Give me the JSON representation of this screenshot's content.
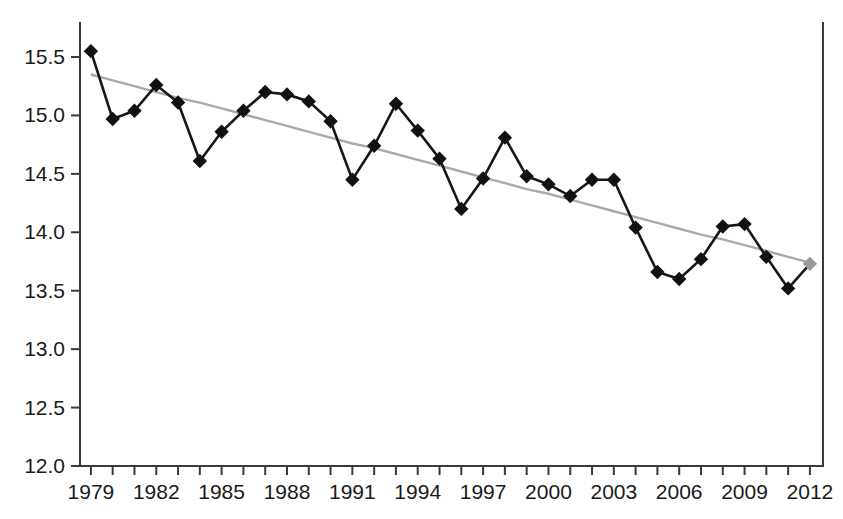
{
  "chart_data": {
    "type": "line",
    "title": "",
    "subtitle": "",
    "xlabel": "",
    "ylabel": "",
    "xlim": [
      1978.5,
      2012.6
    ],
    "ylim": [
      12.0,
      15.7
    ],
    "grid": false,
    "legend": null,
    "y_ticks": [
      "12.0",
      "12.5",
      "13.0",
      "13.5",
      "14.0",
      "14.5",
      "15.0",
      "15.5"
    ],
    "y_tick_values": [
      12.0,
      12.5,
      13.0,
      13.5,
      14.0,
      14.5,
      15.0,
      15.5
    ],
    "x_tick_labels": [
      "1979",
      "1982",
      "1985",
      "1988",
      "1991",
      "1994",
      "1997",
      "2000",
      "2003",
      "2006",
      "2009",
      "2012"
    ],
    "x_tick_values": [
      1979,
      1982,
      1985,
      1988,
      1991,
      1994,
      1997,
      2000,
      2003,
      2006,
      2009,
      2012
    ],
    "x_minor_ticks": [
      1979,
      1980,
      1981,
      1982,
      1983,
      1984,
      1985,
      1986,
      1987,
      1988,
      1989,
      1990,
      1991,
      1992,
      1993,
      1994,
      1995,
      1996,
      1997,
      1998,
      1999,
      2000,
      2001,
      2002,
      2003,
      2004,
      2005,
      2006,
      2007,
      2008,
      2009,
      2010,
      2011,
      2012
    ],
    "x": [
      1979,
      1980,
      1981,
      1982,
      1983,
      1984,
      1985,
      1986,
      1987,
      1988,
      1989,
      1990,
      1991,
      1992,
      1993,
      1994,
      1995,
      1996,
      1997,
      1998,
      1999,
      2000,
      2001,
      2002,
      2003,
      2004,
      2005,
      2006,
      2007,
      2008,
      2009,
      2010,
      2011,
      2012
    ],
    "series": [
      {
        "name": "observed",
        "marker": "diamond",
        "color": "#111111",
        "line_color": "#161616",
        "last_point_color": "#9a9a9a",
        "values": [
          15.55,
          14.97,
          15.04,
          15.26,
          15.11,
          14.61,
          14.86,
          15.04,
          15.2,
          15.18,
          15.12,
          14.95,
          14.45,
          14.74,
          15.1,
          14.87,
          14.63,
          14.2,
          14.46,
          14.81,
          14.48,
          14.41,
          14.31,
          14.45,
          14.45,
          14.04,
          13.66,
          13.6,
          13.77,
          14.05,
          14.07,
          13.79,
          13.52,
          13.73
        ]
      },
      {
        "name": "linear-trend",
        "marker": "none",
        "color": "#a9a9a9",
        "values": [
          15.35,
          15.3,
          15.25,
          15.2,
          15.15,
          15.11,
          15.06,
          15.01,
          14.96,
          14.91,
          14.86,
          14.81,
          14.76,
          14.72,
          14.67,
          14.62,
          14.57,
          14.52,
          14.47,
          14.42,
          14.37,
          14.33,
          14.28,
          14.23,
          14.18,
          14.13,
          14.08,
          14.03,
          13.98,
          13.94,
          13.89,
          13.84,
          13.79,
          13.74
        ]
      }
    ],
    "annotations": []
  },
  "figure": {
    "background": "#ffffff",
    "frame_color": "#3a3a3a"
  }
}
